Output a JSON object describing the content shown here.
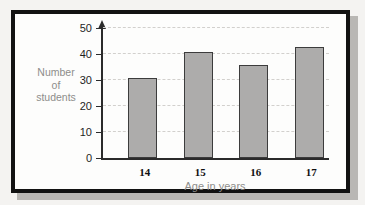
{
  "chart_data": {
    "type": "bar",
    "title": "",
    "xlabel": "Age in years",
    "ylabel": "Number of students",
    "ylabel_lines": [
      "Number",
      "of",
      "students"
    ],
    "categories": [
      "14",
      "15",
      "16",
      "17"
    ],
    "values": [
      30,
      40,
      35,
      42
    ],
    "ylim": [
      0,
      50
    ],
    "yticks": [
      0,
      10,
      20,
      30,
      40,
      50
    ],
    "ytick_labels": [
      "0",
      "10",
      "20",
      "30",
      "40",
      "50"
    ],
    "grid": "horizontal-dashed",
    "legend": "none",
    "colors": {
      "bar_fill": "#adacab",
      "bar_stroke": "#3c3c3c",
      "axis": "#2b2b2b",
      "grid": "#d2d0cd",
      "label_text": "#8e8d8b",
      "tick_text": "#1f1f1f",
      "frame": "#121212",
      "panel_bg": "#fdfdfc",
      "page_bg": "#f4f3f1",
      "shadow": "#b9b7b4"
    }
  }
}
